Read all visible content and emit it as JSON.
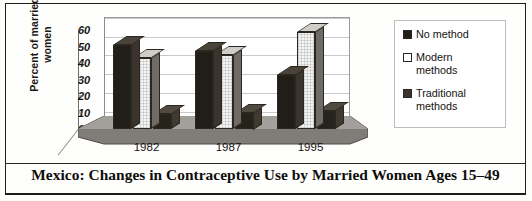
{
  "figure": {
    "title": "Mexico: Changes in Contraceptive Use by Married Women Ages 15–49",
    "y_axis_label": "Percent of married\nwomen"
  },
  "legend": {
    "items": [
      {
        "label": "No method",
        "swatch": "legend-swatch-dark",
        "color": "#211d18"
      },
      {
        "label": "Modern\nmethods",
        "swatch": "legend-swatch-white",
        "color": "#ffffff"
      },
      {
        "label": "Traditional\nmethods",
        "swatch": "legend-swatch-gray",
        "color": "#3a342c"
      }
    ]
  },
  "chart_data": {
    "type": "bar",
    "title": "Mexico: Changes in Contraceptive Use by Married Women Ages 15–49",
    "xlabel": "",
    "ylabel": "Percent of married women",
    "categories": [
      "1982",
      "1987",
      "1995"
    ],
    "series": [
      {
        "name": "No method",
        "values": [
          51,
          47,
          33
        ],
        "color": "#211d18"
      },
      {
        "name": "Modern methods",
        "values": [
          43,
          45,
          59
        ],
        "color": "#f4f4f2"
      },
      {
        "name": "Traditional methods",
        "values": [
          9,
          10,
          11
        ],
        "color": "#3a342c"
      }
    ],
    "ylim": [
      0,
      60
    ],
    "yticks": [
      0,
      10,
      20,
      30,
      40,
      50,
      60
    ],
    "ytick_labels": [
      "0",
      "10",
      "20",
      "30",
      "40",
      "50",
      "60"
    ],
    "grid": true,
    "legend_position": "right",
    "style": "3d-bar"
  }
}
